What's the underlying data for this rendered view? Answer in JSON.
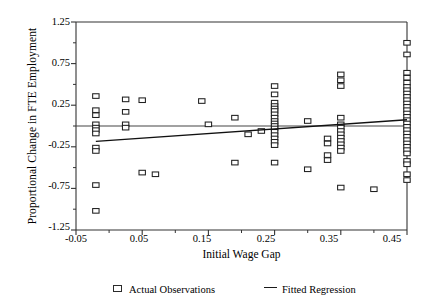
{
  "chart_data": {
    "type": "scatter",
    "title": "",
    "xlabel": "Initial Wage Gap",
    "ylabel": "Proportional Change in FTE Employment",
    "xlim": [
      -0.05,
      0.45
    ],
    "ylim": [
      -1.25,
      1.25
    ],
    "xticks": [
      -0.05,
      0.05,
      0.15,
      0.25,
      0.35,
      0.45
    ],
    "xtick_labels": [
      "-0.05",
      "0.05",
      "0.15",
      "0.25",
      "0.35",
      "0.45"
    ],
    "yticks": [
      -1.25,
      -0.75,
      -0.25,
      0.25,
      0.75,
      1.25
    ],
    "ytick_labels": [
      "-1.25",
      "-0.75",
      "-0.25",
      "0.25",
      "0.75",
      "1.25"
    ],
    "yminorticks": [
      -1.0,
      -0.5,
      0.0,
      0.5,
      1.0
    ],
    "grid": false,
    "zero_line": 0.0,
    "legend": [
      {
        "label": "Actual Observations",
        "marker": "open-square"
      },
      {
        "label": "Fitted Regression",
        "marker": "line"
      }
    ],
    "series": [
      {
        "name": "Actual Observations",
        "marker": "open-square",
        "points": [
          [
            -0.02,
            0.36
          ],
          [
            -0.02,
            0.19
          ],
          [
            -0.02,
            0.13
          ],
          [
            -0.02,
            0.02
          ],
          [
            -0.02,
            -0.02
          ],
          [
            -0.02,
            -0.05
          ],
          [
            -0.02,
            -0.09
          ],
          [
            -0.02,
            -0.26
          ],
          [
            -0.02,
            -0.3
          ],
          [
            -0.02,
            -0.71
          ],
          [
            -0.02,
            -1.02
          ],
          [
            0.025,
            0.32
          ],
          [
            0.025,
            0.17
          ],
          [
            0.025,
            0.02
          ],
          [
            0.025,
            -0.02
          ],
          [
            0.05,
            -0.56
          ],
          [
            0.07,
            -0.58
          ],
          [
            0.05,
            0.31
          ],
          [
            0.14,
            0.3
          ],
          [
            0.15,
            0.02
          ],
          [
            0.19,
            0.1
          ],
          [
            0.19,
            -0.44
          ],
          [
            0.21,
            -0.1
          ],
          [
            0.23,
            -0.06
          ],
          [
            0.25,
            0.48
          ],
          [
            0.25,
            0.38
          ],
          [
            0.25,
            0.28
          ],
          [
            0.25,
            0.24
          ],
          [
            0.25,
            0.21
          ],
          [
            0.25,
            0.18
          ],
          [
            0.25,
            0.14
          ],
          [
            0.25,
            0.1
          ],
          [
            0.25,
            0.06
          ],
          [
            0.25,
            0.03
          ],
          [
            0.25,
            0.0
          ],
          [
            0.25,
            -0.03
          ],
          [
            0.25,
            -0.07
          ],
          [
            0.25,
            -0.11
          ],
          [
            0.25,
            -0.15
          ],
          [
            0.25,
            -0.19
          ],
          [
            0.25,
            -0.23
          ],
          [
            0.25,
            -0.44
          ],
          [
            0.3,
            0.06
          ],
          [
            0.3,
            -0.52
          ],
          [
            0.33,
            -0.15
          ],
          [
            0.33,
            -0.21
          ],
          [
            0.33,
            -0.35
          ],
          [
            0.33,
            -0.41
          ],
          [
            0.35,
            0.62
          ],
          [
            0.35,
            0.55
          ],
          [
            0.35,
            0.48
          ],
          [
            0.35,
            0.1
          ],
          [
            0.35,
            0.02
          ],
          [
            0.35,
            -0.02
          ],
          [
            0.35,
            -0.06
          ],
          [
            0.35,
            -0.1
          ],
          [
            0.35,
            -0.14
          ],
          [
            0.35,
            -0.18
          ],
          [
            0.35,
            -0.22
          ],
          [
            0.35,
            -0.26
          ],
          [
            0.35,
            -0.3
          ],
          [
            0.35,
            -0.74
          ],
          [
            0.4,
            -0.76
          ],
          [
            0.45,
            1.0
          ],
          [
            0.45,
            0.86
          ],
          [
            0.45,
            0.64
          ],
          [
            0.45,
            0.58
          ],
          [
            0.45,
            0.52
          ],
          [
            0.45,
            0.47
          ],
          [
            0.45,
            0.43
          ],
          [
            0.45,
            0.39
          ],
          [
            0.45,
            0.35
          ],
          [
            0.45,
            0.31
          ],
          [
            0.45,
            0.27
          ],
          [
            0.45,
            0.23
          ],
          [
            0.45,
            0.19
          ],
          [
            0.45,
            0.15
          ],
          [
            0.45,
            0.11
          ],
          [
            0.45,
            0.07
          ],
          [
            0.45,
            0.03
          ],
          [
            0.45,
            -0.01
          ],
          [
            0.45,
            -0.05
          ],
          [
            0.45,
            -0.09
          ],
          [
            0.45,
            -0.13
          ],
          [
            0.45,
            -0.17
          ],
          [
            0.45,
            -0.21
          ],
          [
            0.45,
            -0.25
          ],
          [
            0.45,
            -0.29
          ],
          [
            0.45,
            -0.33
          ],
          [
            0.45,
            -0.42
          ],
          [
            0.45,
            -0.46
          ],
          [
            0.45,
            -0.58
          ],
          [
            0.45,
            -0.65
          ]
        ]
      }
    ],
    "fitted_regression": {
      "name": "Fitted Regression",
      "x_start": -0.02,
      "y_start": -0.185,
      "x_end": 0.45,
      "y_end": 0.075
    },
    "horizontal_reference_line": {
      "y": 0.0,
      "x_start": -0.05,
      "x_end": 0.45
    }
  }
}
